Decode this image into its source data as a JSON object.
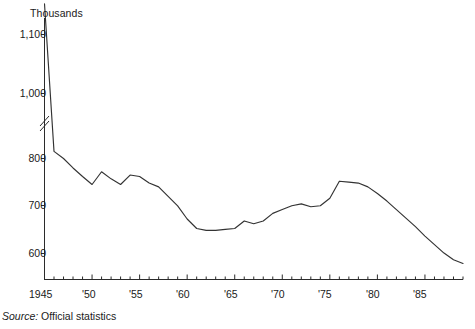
{
  "chart_data": {
    "type": "line",
    "title": "",
    "subtitle": "",
    "unit_label": "Thousands",
    "xlabel": "",
    "ylabel": "",
    "source_prefix": "Source:",
    "source_text": " Official statistics",
    "grid": false,
    "legend": "none",
    "axis_break": {
      "present": true,
      "between": [
        800,
        1000
      ],
      "note": "y-axis is broken; region between 800 and 1,000 is compressed"
    },
    "ylim": [
      560,
      1160
    ],
    "yticks": [
      600,
      700,
      800,
      1000,
      1100
    ],
    "ytick_labels": [
      "600",
      "700",
      "800",
      "1,000",
      "1,100"
    ],
    "xlim": [
      1945,
      1989
    ],
    "xticks": [
      1945,
      1950,
      1955,
      1960,
      1965,
      1970,
      1975,
      1980,
      1985
    ],
    "xtick_labels": [
      "1945",
      "'50",
      "'55",
      "'60",
      "'65",
      "'70",
      "'75",
      "'80",
      "'85"
    ],
    "xtick_minor_every": 1,
    "x": [
      1945,
      1946,
      1947,
      1948,
      1949,
      1950,
      1951,
      1952,
      1953,
      1954,
      1955,
      1956,
      1957,
      1958,
      1959,
      1960,
      1961,
      1962,
      1963,
      1964,
      1965,
      1966,
      1967,
      1968,
      1969,
      1970,
      1971,
      1972,
      1973,
      1974,
      1975,
      1976,
      1977,
      1978,
      1979,
      1980,
      1981,
      1982,
      1983,
      1984,
      1985,
      1986,
      1987,
      1988,
      1989
    ],
    "series": [
      {
        "name": "Official statistics series",
        "color": "#333333",
        "values": [
          1152,
          822,
          800,
          780,
          762,
          745,
          772,
          757,
          745,
          765,
          762,
          748,
          740,
          720,
          700,
          672,
          652,
          648,
          648,
          650,
          652,
          668,
          662,
          668,
          684,
          692,
          700,
          704,
          698,
          700,
          716,
          752,
          750,
          748,
          740,
          726,
          710,
          692,
          674,
          656,
          636,
          618,
          600,
          586,
          578
        ]
      }
    ]
  }
}
